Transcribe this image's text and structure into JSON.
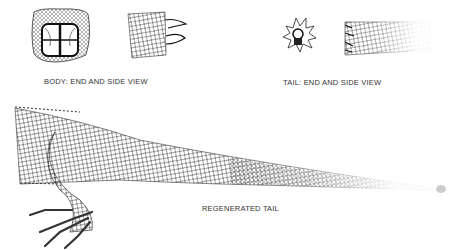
{
  "labels": {
    "body": "BODY: END AND SIDE VIEW",
    "tail": "TAIL: END AND SIDE VIEW",
    "regenerated": "REGENERATED TAIL"
  },
  "figures": [
    {
      "name": "body-end-view",
      "description": "cross-section of body"
    },
    {
      "name": "body-side-view",
      "description": "scaled body segment"
    },
    {
      "name": "tail-end-view",
      "description": "cross-section of tail with spiny scales"
    },
    {
      "name": "tail-side-view",
      "description": "scaled tail segment"
    },
    {
      "name": "lizard-regenerated-tail",
      "description": "lizard hind leg and regenerated tail tapering to a point"
    }
  ],
  "colors": {
    "ink": "#222222",
    "background": "#ffffff"
  }
}
